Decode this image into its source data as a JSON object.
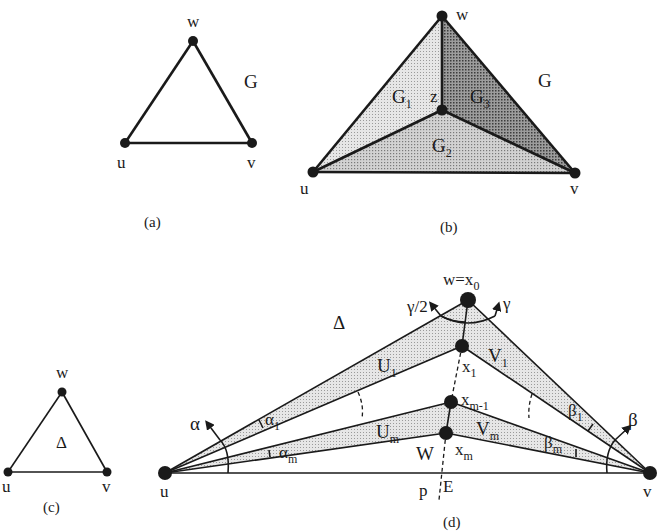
{
  "figure": {
    "panels": [
      {
        "id": "a",
        "caption": "(a)",
        "vertices": {
          "w": "w",
          "u": "u",
          "v": "v"
        },
        "graph_label": "G"
      },
      {
        "id": "b",
        "caption": "(b)",
        "vertices": {
          "w": "w",
          "u": "u",
          "v": "v",
          "z": "z"
        },
        "graph_label": "G",
        "regions": [
          {
            "name": "G",
            "sub": "1",
            "shade": "#dcdcdc"
          },
          {
            "name": "G",
            "sub": "2",
            "shade": "#c8c8c8"
          },
          {
            "name": "G",
            "sub": "3",
            "shade": "#8c8c8c"
          }
        ]
      },
      {
        "id": "c",
        "caption": "(c)",
        "vertices": {
          "w": "w",
          "u": "u",
          "v": "v"
        },
        "face_label": "Δ"
      },
      {
        "id": "d",
        "caption": "(d)",
        "vertices": {
          "top": {
            "main": "w=x",
            "sub": "0"
          },
          "x1": {
            "main": "x",
            "sub": "1"
          },
          "xm1": {
            "main": "x",
            "sub": "m-1"
          },
          "xm": {
            "main": "x",
            "sub": "m"
          },
          "u": "u",
          "v": "v"
        },
        "face_label": "Δ",
        "angles": {
          "gamma_half": "γ/2",
          "gamma": "γ",
          "alpha": "α",
          "beta": "β",
          "alpha1": {
            "main": "α",
            "sub": "1"
          },
          "alpham": {
            "main": "α",
            "sub": "m"
          },
          "beta1": {
            "main": "β",
            "sub": "1"
          },
          "betam": {
            "main": "β",
            "sub": "m"
          }
        },
        "regions": {
          "U1": {
            "main": "U",
            "sub": "1"
          },
          "V1": {
            "main": "V",
            "sub": "1"
          },
          "Um": {
            "main": "U",
            "sub": "m"
          },
          "Vm": {
            "main": "V",
            "sub": "m"
          },
          "W": "W"
        },
        "line_labels": {
          "p": "p",
          "E": "E"
        }
      }
    ],
    "colors": {
      "ink": "#1a1a1a",
      "light_shade": "#dedede",
      "mid_shade": "#c8c8c8",
      "dark_shade": "#8c8c8c",
      "background": "#ffffff"
    }
  }
}
